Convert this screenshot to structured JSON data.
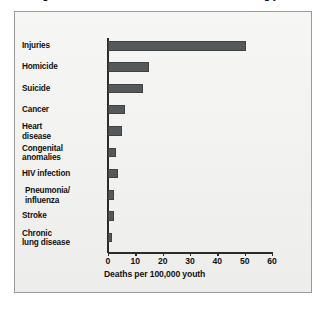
{
  "figure": {
    "title": "Figure 1. Death rates for selected causes among youth",
    "background_color": "#ffffff",
    "panel_color": "#f3f3f1",
    "panel_border_color": "#9a9a9a",
    "bar_color": "#56595a",
    "axis_color": "#2b2b2b",
    "text_color": "#111111"
  },
  "chart_data": {
    "type": "bar",
    "orientation": "horizontal",
    "title": "Figure 1. Death rates for selected causes among youth",
    "xlabel": "Deaths per 100,000 youth",
    "ylabel": "",
    "xlim": [
      0,
      60
    ],
    "xticks": [
      0,
      10,
      20,
      30,
      40,
      50,
      60
    ],
    "xticklabels": [
      "0",
      "10",
      "20",
      "30",
      "40",
      "50",
      "60"
    ],
    "grid": false,
    "legend": false,
    "categories": [
      "Injuries",
      "Homicide",
      "Suicide",
      "Cancer",
      "Heart disease",
      "Congenital anomalies",
      "HIV infection",
      "Pneumonia/ influenza",
      "Stroke",
      "Chronic lung disease"
    ],
    "category_lines": [
      [
        "Injuries",
        ""
      ],
      [
        "Homicide",
        ""
      ],
      [
        "Suicide",
        ""
      ],
      [
        "Cancer",
        ""
      ],
      [
        "Heart",
        "disease"
      ],
      [
        "Congenital",
        "anomalies"
      ],
      [
        "HIV infection",
        ""
      ],
      [
        "Pneumonia/",
        "influenza"
      ],
      [
        "Stroke",
        ""
      ],
      [
        "Chronic",
        "lung disease"
      ]
    ],
    "values": [
      50.5,
      15.0,
      12.8,
      6.2,
      5.1,
      2.9,
      3.7,
      2.2,
      2.2,
      1.5
    ],
    "series": [
      {
        "name": "Deaths per 100,000 youth",
        "values": [
          50.5,
          15.0,
          12.8,
          6.2,
          5.1,
          2.9,
          3.7,
          2.2,
          2.2,
          1.5
        ]
      }
    ]
  }
}
